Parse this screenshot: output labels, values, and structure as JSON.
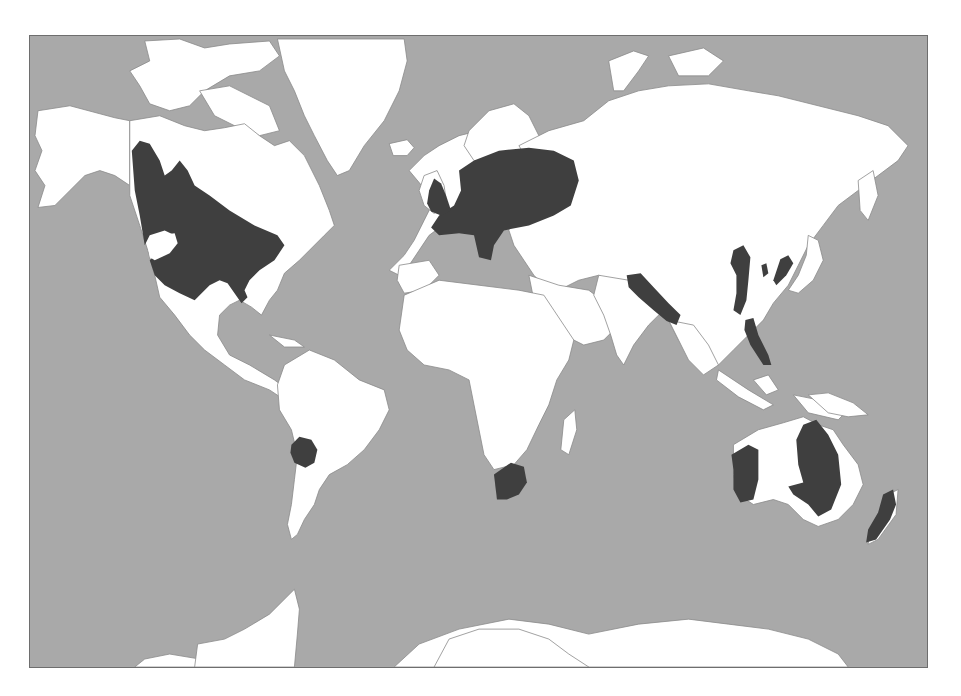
{
  "map": {
    "type": "world-distribution-map",
    "projection": "mercator",
    "colors": {
      "ocean": "#a9a9a9",
      "land": "#ffffff",
      "borders": "#8a8a8a",
      "distribution": "#3f3f3f",
      "frame": "#6e6e6e",
      "background": "#ffffff"
    },
    "regions_highlighted": [
      "North America (Canada / USA)",
      "Western & Central Europe",
      "Italy",
      "Himalaya / Northern India",
      "Eastern China",
      "Korea / Japan",
      "Taiwan to Philippines",
      "Southeastern South America (Uruguay / NE Argentina)",
      "South Africa",
      "Western Australia",
      "Eastern Australia",
      "New Zealand"
    ]
  }
}
